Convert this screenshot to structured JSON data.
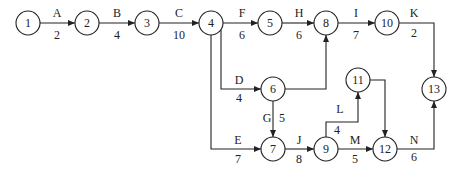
{
  "diagram": {
    "type": "activity-on-arrow network",
    "nodes": [
      {
        "id": "1",
        "x": 28,
        "y": 23
      },
      {
        "id": "2",
        "x": 87,
        "y": 23
      },
      {
        "id": "3",
        "x": 147,
        "y": 23
      },
      {
        "id": "4",
        "x": 211,
        "y": 23
      },
      {
        "id": "5",
        "x": 270,
        "y": 23
      },
      {
        "id": "8",
        "x": 326,
        "y": 23
      },
      {
        "id": "10",
        "x": 387,
        "y": 23
      },
      {
        "id": "6",
        "x": 273,
        "y": 89
      },
      {
        "id": "11",
        "x": 358,
        "y": 80
      },
      {
        "id": "13",
        "x": 434,
        "y": 89
      },
      {
        "id": "7",
        "x": 273,
        "y": 149
      },
      {
        "id": "9",
        "x": 326,
        "y": 149
      },
      {
        "id": "12",
        "x": 385,
        "y": 149
      }
    ],
    "activities": [
      {
        "name": "A",
        "duration": "2",
        "from": "1",
        "to": "2"
      },
      {
        "name": "B",
        "duration": "4",
        "from": "2",
        "to": "3"
      },
      {
        "name": "C",
        "duration": "10",
        "from": "3",
        "to": "4"
      },
      {
        "name": "F",
        "duration": "6",
        "from": "4",
        "to": "5"
      },
      {
        "name": "H",
        "duration": "6",
        "from": "5",
        "to": "8"
      },
      {
        "name": "I",
        "duration": "7",
        "from": "8",
        "to": "10"
      },
      {
        "name": "K",
        "duration": "2",
        "from": "10",
        "to": "13"
      },
      {
        "name": "D",
        "duration": "4",
        "from": "4",
        "to": "6"
      },
      {
        "name": "E",
        "duration": "7",
        "from": "4",
        "to": "7"
      },
      {
        "name": "G",
        "duration": "5",
        "from": "6",
        "to": "7"
      },
      {
        "name": "J",
        "duration": "8",
        "from": "7",
        "to": "9"
      },
      {
        "name": "L",
        "duration": "4",
        "from": "9",
        "to": "11"
      },
      {
        "name": "M",
        "duration": "5",
        "from": "9",
        "to": "12"
      },
      {
        "name": "N",
        "duration": "6",
        "from": "12",
        "to": "13"
      }
    ],
    "dummy_edges": [
      {
        "from": "6",
        "to": "8"
      },
      {
        "from": "11",
        "to": "12"
      }
    ]
  }
}
